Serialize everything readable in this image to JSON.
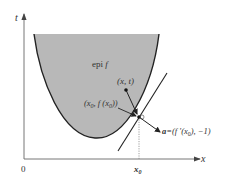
{
  "diagram": {
    "axes": {
      "x_label": "x",
      "y_label": "t",
      "origin_label": "0",
      "x0_label": "x",
      "x0_sub": "0"
    },
    "region": {
      "label": "epi f",
      "label_prefix": "epi ",
      "label_var": "f",
      "fill": "#b8b8b8"
    },
    "points": {
      "xt_label": "(x, t)",
      "x0_point_label_a": "(x",
      "x0_point_label_sub": "0",
      "x0_point_label_b": ", f (x",
      "x0_point_label_sub2": "0",
      "x0_point_label_c": "))"
    },
    "normal_vector": {
      "label_a": "a",
      "label_b": "=(f ′(x",
      "label_sub": "0",
      "label_c": "), −1)"
    },
    "colors": {
      "stroke": "#222222",
      "fill": "#b8b8b8",
      "axis": "#555555",
      "dotted": "#888888"
    }
  }
}
